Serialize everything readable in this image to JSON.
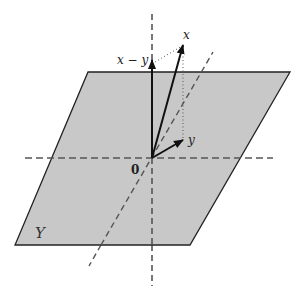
{
  "diagram": {
    "colors": {
      "plane_fill": "#c8c8c8",
      "plane_stroke": "#222222",
      "axis_dash": "#555555",
      "vector": "#111111",
      "dotted": "#555555",
      "background": "#ffffff"
    },
    "labels": {
      "plane": "Y",
      "origin": "0",
      "vector_x": "x",
      "vector_y": "y",
      "vector_x_minus_y": "x − y"
    },
    "elements": [
      {
        "kind": "plane",
        "name": "Y",
        "description": "shaded parallelogram subspace"
      },
      {
        "kind": "axis",
        "style": "dashed",
        "description": "vertical axis through origin"
      },
      {
        "kind": "axis",
        "style": "dashed",
        "description": "horizontal axis through origin"
      },
      {
        "kind": "axis",
        "style": "dashed",
        "description": "diagonal axis through origin"
      },
      {
        "kind": "vector",
        "name": "x",
        "description": "vector from origin pointing up-right, out of plane"
      },
      {
        "kind": "vector",
        "name": "y",
        "description": "projection of x onto plane Y"
      },
      {
        "kind": "vector",
        "name": "x − y",
        "description": "vertical component orthogonal to Y"
      },
      {
        "kind": "guide",
        "style": "dotted",
        "description": "drop line from tip of x to tip of y"
      },
      {
        "kind": "guide",
        "style": "dotted",
        "description": "line from tip of x − y to tip of x"
      }
    ]
  }
}
